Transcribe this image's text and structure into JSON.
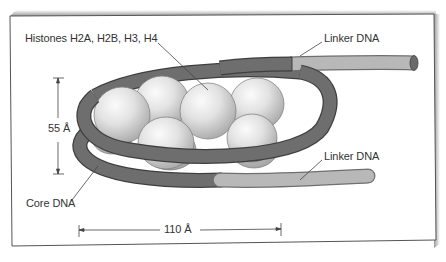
{
  "figure": {
    "labels": {
      "histones": "Histones H2A, H2B, H3, H4",
      "linker_top": "Linker DNA",
      "linker_bottom": "Linker DNA",
      "core_dna": "Core DNA",
      "height": "55 Å",
      "width": "110 Å"
    },
    "colors": {
      "frame_border": "#555555",
      "frame_shadow": "#bdbdbd",
      "core_dna": "#6e6e6e",
      "core_dna_edge": "#3f3f3f",
      "linker_dna": "#b8b8b8",
      "histone_light": "#f4f4f4",
      "histone_dark": "#a9a9a9",
      "text": "#333333"
    }
  }
}
